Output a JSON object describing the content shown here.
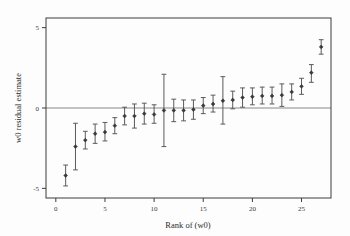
{
  "chart_data": {
    "type": "scatter",
    "subtype": "caterpillar-plot-with-error-bars",
    "title": "",
    "xlabel": "Rank of (w0)",
    "ylabel": "w0 residual estimate",
    "xlim": [
      -1,
      28
    ],
    "ylim": [
      -5.6,
      5.6
    ],
    "xticks": [
      0,
      5,
      10,
      15,
      20,
      25
    ],
    "xticklabels": [
      "0",
      "5",
      "10",
      "15",
      "20",
      "25"
    ],
    "yticks": [
      5,
      0,
      -5
    ],
    "yticklabels": [
      "5",
      "0",
      "-5"
    ],
    "grid": false,
    "legend": null,
    "reference_lines": [
      {
        "axis": "y",
        "value": 0,
        "style": "solid",
        "color": "#888888"
      }
    ],
    "x": [
      1,
      2,
      3,
      4,
      5,
      6,
      7,
      8,
      9,
      10,
      11,
      12,
      13,
      14,
      15,
      16,
      17,
      18,
      19,
      20,
      21,
      22,
      23,
      24,
      25,
      26,
      27
    ],
    "values": [
      -4.2,
      -2.4,
      -2.0,
      -1.6,
      -1.5,
      -1.1,
      -0.5,
      -0.5,
      -0.35,
      -0.4,
      -0.15,
      -0.15,
      -0.15,
      -0.1,
      0.15,
      0.25,
      0.45,
      0.5,
      0.65,
      0.7,
      0.75,
      0.75,
      0.8,
      1.0,
      1.35,
      2.2,
      3.8
    ],
    "error_low": [
      -4.85,
      -3.85,
      -2.55,
      -2.2,
      -2.05,
      -1.6,
      -1.05,
      -1.25,
      -1.0,
      -0.95,
      -2.4,
      -0.85,
      -0.8,
      -0.7,
      -0.35,
      -0.25,
      -1.0,
      -0.05,
      0.05,
      0.2,
      0.25,
      0.25,
      0.1,
      0.5,
      0.85,
      1.6,
      3.35
    ],
    "error_high": [
      -3.55,
      -0.95,
      -1.45,
      -1.0,
      -0.9,
      -0.6,
      0.05,
      0.25,
      0.3,
      0.2,
      2.1,
      0.55,
      0.5,
      0.5,
      0.65,
      0.8,
      1.95,
      1.05,
      1.25,
      1.25,
      1.3,
      1.3,
      1.5,
      1.5,
      1.85,
      2.7,
      4.25
    ],
    "marker": "filled-diamond",
    "point_color": "#3a3a3a",
    "errorbar_color": "#5a5a5a"
  },
  "axes": {
    "x_title": "Rank of (w0)",
    "y_title": "w0 residual estimate"
  }
}
